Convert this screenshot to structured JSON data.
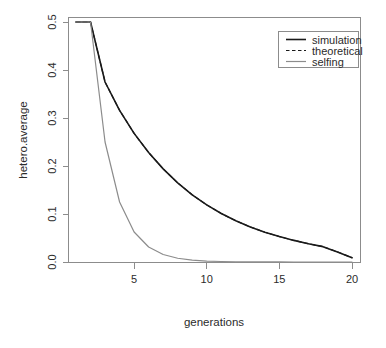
{
  "chart_data": {
    "type": "line",
    "title": "",
    "xlabel": "generations",
    "ylabel": "hetero.average",
    "xlim": [
      1,
      20
    ],
    "ylim": [
      0.0,
      0.5
    ],
    "grid": false,
    "legend_position": "top-right",
    "xticks": [
      5,
      10,
      15,
      20
    ],
    "xtick_labels": [
      "5",
      "10",
      "15",
      "20"
    ],
    "yticks": [
      0.0,
      0.1,
      0.2,
      0.3,
      0.4,
      0.5
    ],
    "ytick_labels": [
      "0.0",
      "0.1",
      "0.2",
      "0.3",
      "0.4",
      "0.5"
    ],
    "x": [
      1,
      2,
      3,
      4,
      5,
      6,
      7,
      8,
      9,
      10,
      11,
      12,
      13,
      14,
      15,
      16,
      17,
      18,
      19,
      20
    ],
    "series": [
      {
        "name": "simulation",
        "style": "solid",
        "color": "#1a1a1a",
        "width": 1.6,
        "values": [
          0.5,
          0.5,
          0.375,
          0.316,
          0.268,
          0.228,
          0.194,
          0.165,
          0.14,
          0.119,
          0.101,
          0.086,
          0.073,
          0.062,
          0.053,
          0.045,
          0.038,
          0.032,
          0.021,
          0.009
        ]
      },
      {
        "name": "theoretical",
        "style": "dashed",
        "color": "#1a1a1a",
        "width": 1.2,
        "values": [
          0.5,
          0.5,
          0.375,
          0.316,
          0.268,
          0.228,
          0.194,
          0.165,
          0.14,
          0.119,
          0.101,
          0.086,
          0.073,
          0.062,
          0.053,
          0.045,
          0.038,
          0.032,
          0.021,
          0.009
        ]
      },
      {
        "name": "selfing",
        "style": "solid",
        "color": "#8c8c8c",
        "width": 1.2,
        "values": [
          0.5,
          0.5,
          0.25,
          0.125,
          0.0625,
          0.0313,
          0.0156,
          0.0078,
          0.0039,
          0.002,
          0.001,
          0.0005,
          0.0002,
          0.0001,
          0.0001,
          0.0,
          0.0,
          0.0,
          0.0,
          0.0
        ]
      }
    ]
  },
  "legend": {
    "entries": [
      {
        "label": "simulation"
      },
      {
        "label": "theoretical"
      },
      {
        "label": "selfing"
      }
    ]
  },
  "axes": {
    "x_label": "generations",
    "y_label": "hetero.average"
  },
  "colors": {
    "simulation": "#1a1a1a",
    "theoretical": "#1a1a1a",
    "selfing": "#8c8c8c",
    "axis": "#8c8c8c",
    "background": "#ffffff",
    "text": "#2b2b2b"
  }
}
